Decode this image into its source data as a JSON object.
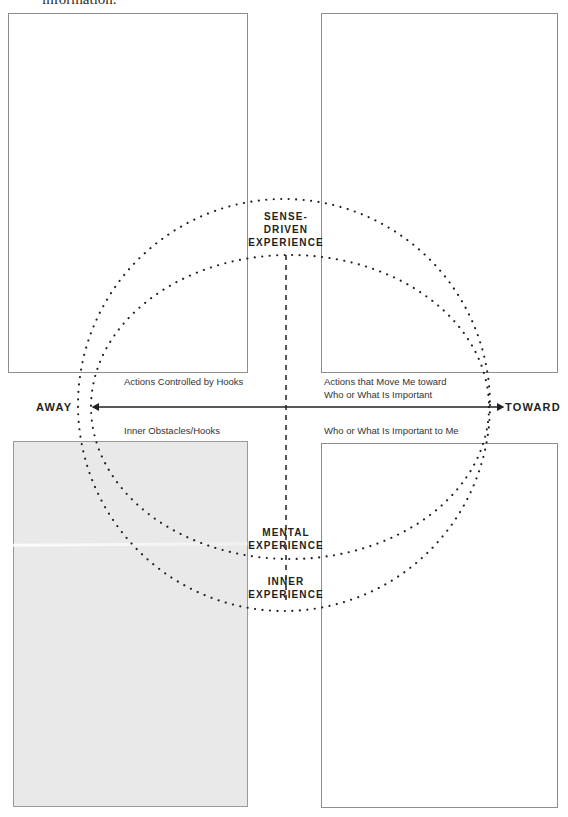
{
  "page": {
    "width": 568,
    "height": 817,
    "background": "#ffffff",
    "ink_color": "#231f20",
    "box_border_color": "#8d8d8d",
    "shaded_box_fill": "#e9e9e9"
  },
  "running_text": {
    "text": "information."
  },
  "diagram": {
    "title_labels": {
      "sense_driven": "SENSE-\nDRIVEN\nEXPERIENCE",
      "sense_driven_lines": [
        "SENSE-",
        "DRIVEN",
        "EXPERIENCE"
      ],
      "mental": "MENTAL\nEXPERIENCE",
      "mental_lines": [
        "MENTAL",
        "EXPERIENCE"
      ],
      "inner": "INNER\nEXPERIENCE",
      "inner_lines": [
        "INNER",
        "EXPERIENCE"
      ]
    },
    "axis": {
      "left_pole": "AWAY",
      "right_pole": "TOWARD",
      "orientation": "horizontal",
      "arrowheads": "both"
    },
    "quadrant_labels": {
      "top_left": "Actions Controlled by Hooks",
      "top_right_lines": [
        "Actions that Move Me toward",
        "Who or What Is Important"
      ],
      "bottom_left": "Inner Obstacles/Hooks",
      "bottom_right": "Who or What Is Important to Me"
    },
    "rings": {
      "outer": {
        "cx": 284,
        "cy": 405,
        "rx": 206,
        "ry": 206,
        "style": "dotted"
      },
      "inner": {
        "cx": 290,
        "cy": 407,
        "rx": 199,
        "ry": 152,
        "style": "dotted"
      }
    },
    "vertical_divider": {
      "x": 286,
      "y1": 255,
      "y2": 602,
      "style": "dashed"
    }
  },
  "worksheet_boxes": [
    {
      "name": "top-left-box",
      "fill": "#ffffff",
      "content": ""
    },
    {
      "name": "top-right-box",
      "fill": "#ffffff",
      "content": ""
    },
    {
      "name": "bottom-left-box",
      "fill": "#e9e9e9",
      "content": ""
    },
    {
      "name": "bottom-right-box",
      "fill": "#ffffff",
      "content": ""
    }
  ]
}
